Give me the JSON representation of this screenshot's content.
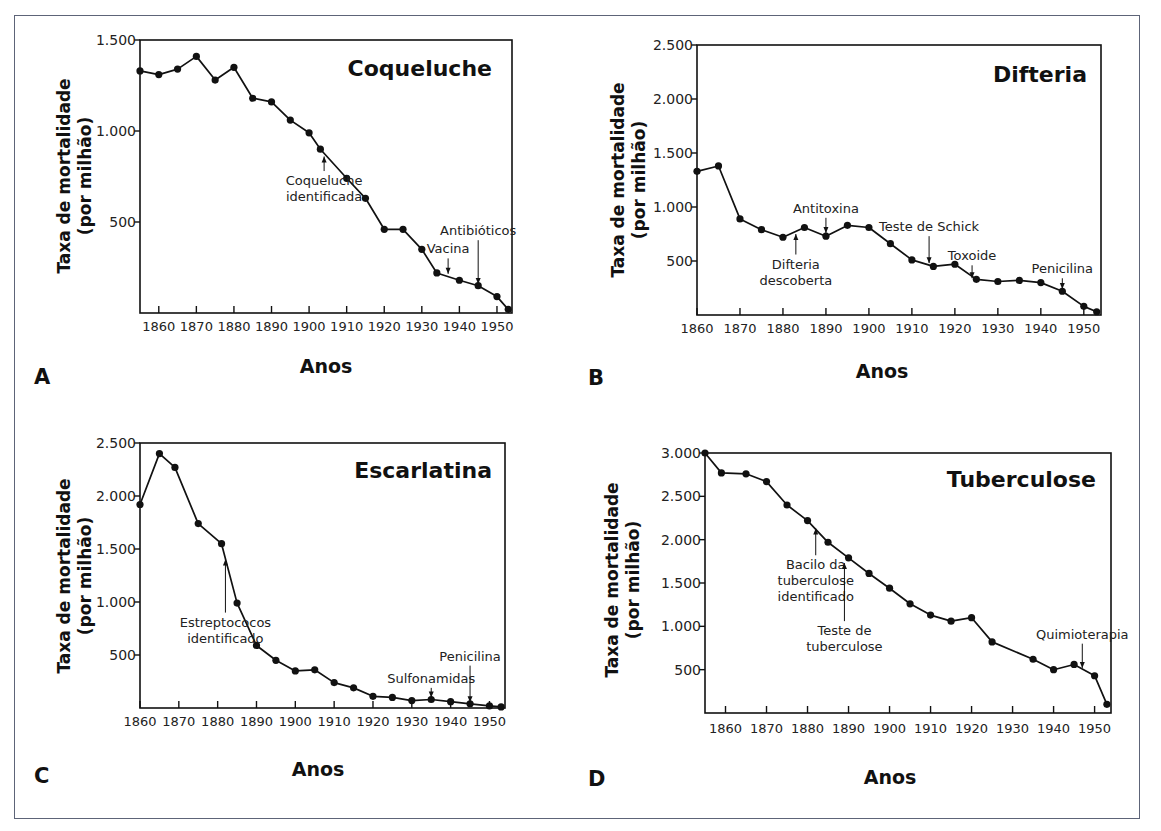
{
  "figure": {
    "border_color": "#5d6478",
    "line_color": "#111111"
  },
  "chart_data": [
    {
      "panel": "A",
      "type": "line",
      "title": "Coqueluche",
      "xlabel": "Anos",
      "ylabel": "Taxa de mortalidade (por milhão)",
      "xlim": [
        1855,
        1954
      ],
      "ylim": [
        0,
        1500
      ],
      "xticks": [
        1860,
        1870,
        1880,
        1890,
        1900,
        1910,
        1920,
        1930,
        1940,
        1950
      ],
      "yticks": [
        {
          "value": 500,
          "label": "500"
        },
        {
          "value": 1000,
          "label": "1.000"
        },
        {
          "value": 1500,
          "label": "1.500"
        }
      ],
      "grid": false,
      "x": [
        1855,
        1860,
        1865,
        1870,
        1875,
        1880,
        1885,
        1890,
        1895,
        1900,
        1903,
        1910,
        1915,
        1920,
        1925,
        1930,
        1934,
        1940,
        1945,
        1950,
        1953
      ],
      "values": [
        1330,
        1310,
        1340,
        1410,
        1280,
        1350,
        1180,
        1160,
        1060,
        990,
        900,
        740,
        630,
        460,
        460,
        350,
        220,
        180,
        150,
        90,
        20
      ],
      "annotations": [
        {
          "text": [
            "Coqueluche",
            "identificada"
          ],
          "x": 1904,
          "arrow_from": 780,
          "arrow_to": 860,
          "direction": "up"
        },
        {
          "text": [
            "Vacina"
          ],
          "x": 1937,
          "arrow_from": 300,
          "arrow_to": 215,
          "direction": "down"
        },
        {
          "text": [
            "Antibióticos"
          ],
          "x": 1945,
          "arrow_from": 400,
          "arrow_to": 160,
          "direction": "down"
        }
      ]
    },
    {
      "panel": "B",
      "type": "line",
      "title": "Difteria",
      "xlabel": "Anos",
      "ylabel": "Taxa de mortalidade (por milhão)",
      "xlim": [
        1860,
        1954
      ],
      "ylim": [
        0,
        2500
      ],
      "xticks": [
        1860,
        1870,
        1880,
        1890,
        1900,
        1910,
        1920,
        1930,
        1940,
        1950
      ],
      "yticks": [
        {
          "value": 500,
          "label": "500"
        },
        {
          "value": 1000,
          "label": "1.000"
        },
        {
          "value": 1500,
          "label": "1.500"
        },
        {
          "value": 2000,
          "label": "2.000"
        },
        {
          "value": 2500,
          "label": "2.500"
        }
      ],
      "grid": false,
      "x": [
        1860,
        1865,
        1870,
        1875,
        1880,
        1885,
        1890,
        1895,
        1900,
        1905,
        1910,
        1915,
        1920,
        1925,
        1930,
        1935,
        1940,
        1945,
        1950,
        1953
      ],
      "values": [
        1330,
        1380,
        890,
        790,
        720,
        810,
        730,
        830,
        810,
        660,
        510,
        450,
        470,
        330,
        310,
        320,
        300,
        220,
        80,
        30
      ],
      "annotations": [
        {
          "text": [
            "Antitoxina"
          ],
          "x": 1890,
          "arrow_from": 900,
          "arrow_to": 760,
          "direction": "down"
        },
        {
          "text": [
            "Difteria",
            "descoberta"
          ],
          "x": 1883,
          "arrow_from": 560,
          "arrow_to": 750,
          "direction": "up"
        },
        {
          "text": [
            "Teste de Schick"
          ],
          "x": 1914,
          "arrow_from": 730,
          "arrow_to": 480,
          "direction": "down"
        },
        {
          "text": [
            "Toxoide"
          ],
          "x": 1924,
          "arrow_from": 460,
          "arrow_to": 340,
          "direction": "down"
        },
        {
          "text": [
            "Penicilina"
          ],
          "x": 1945,
          "arrow_from": 340,
          "arrow_to": 240,
          "direction": "down"
        }
      ]
    },
    {
      "panel": "C",
      "type": "line",
      "title": "Escarlatina",
      "xlabel": "Anos",
      "ylabel": "Taxa de mortalidade (por milhão)",
      "xlim": [
        1860,
        1954
      ],
      "ylim": [
        0,
        2500
      ],
      "xticks": [
        1860,
        1870,
        1880,
        1890,
        1900,
        1910,
        1920,
        1930,
        1940,
        1950
      ],
      "yticks": [
        {
          "value": 500,
          "label": "500"
        },
        {
          "value": 1000,
          "label": "1.000"
        },
        {
          "value": 1500,
          "label": "1.500"
        },
        {
          "value": 2000,
          "label": "2.000"
        },
        {
          "value": 2500,
          "label": "2.500"
        }
      ],
      "grid": false,
      "x": [
        1860,
        1865,
        1869,
        1875,
        1881,
        1885,
        1890,
        1895,
        1900,
        1905,
        1910,
        1915,
        1920,
        1925,
        1930,
        1935,
        1940,
        1945,
        1950,
        1953
      ],
      "values": [
        1920,
        2400,
        2270,
        1740,
        1550,
        990,
        590,
        450,
        350,
        360,
        240,
        190,
        110,
        100,
        70,
        80,
        60,
        40,
        20,
        10
      ],
      "annotations": [
        {
          "text": [
            "Estreptococos",
            "identificado"
          ],
          "x": 1882,
          "arrow_from": 900,
          "arrow_to": 1400,
          "direction": "up"
        },
        {
          "text": [
            "Sulfonamidas"
          ],
          "x": 1935,
          "arrow_from": 190,
          "arrow_to": 100,
          "direction": "down"
        },
        {
          "text": [
            "Penicilina"
          ],
          "x": 1945,
          "arrow_from": 400,
          "arrow_to": 55,
          "direction": "down"
        }
      ]
    },
    {
      "panel": "D",
      "type": "line",
      "title": "Tuberculose",
      "xlabel": "Anos",
      "ylabel": "Taxa de mortalidade (por milhão)",
      "xlim": [
        1855,
        1954
      ],
      "ylim": [
        0,
        3000
      ],
      "xticks": [
        1860,
        1870,
        1880,
        1890,
        1900,
        1910,
        1920,
        1930,
        1940,
        1950
      ],
      "yticks": [
        {
          "value": 500,
          "label": "500"
        },
        {
          "value": 1000,
          "label": "1.000"
        },
        {
          "value": 1500,
          "label": "1.500"
        },
        {
          "value": 2000,
          "label": "2.000"
        },
        {
          "value": 2500,
          "label": "2.500"
        },
        {
          "value": 3000,
          "label": "3.000"
        }
      ],
      "grid": false,
      "x": [
        1855,
        1859,
        1865,
        1870,
        1875,
        1880,
        1885,
        1890,
        1895,
        1900,
        1905,
        1910,
        1915,
        1920,
        1925,
        1935,
        1940,
        1945,
        1950,
        1953
      ],
      "values": [
        3000,
        2770,
        2760,
        2670,
        2400,
        2220,
        1970,
        1790,
        1610,
        1440,
        1260,
        1130,
        1060,
        1100,
        820,
        620,
        500,
        560,
        430,
        100
      ],
      "annotations": [
        {
          "text": [
            "Bacilo da",
            "tuberculose",
            "identificado"
          ],
          "x": 1882,
          "arrow_from": 1820,
          "arrow_to": 2130,
          "direction": "up"
        },
        {
          "text": [
            "Teste de",
            "tuberculose"
          ],
          "x": 1889,
          "arrow_from": 1060,
          "arrow_to": 1730,
          "direction": "up"
        },
        {
          "text": [
            "Quimioterapia"
          ],
          "x": 1947,
          "arrow_from": 800,
          "arrow_to": 520,
          "direction": "down"
        }
      ]
    }
  ]
}
